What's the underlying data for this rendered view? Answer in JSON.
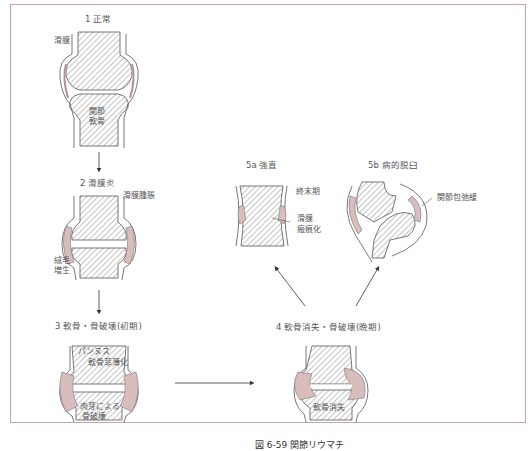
{
  "figure": {
    "caption": "図 6-59  関節リウマチ",
    "frame_color": "#c9a3a6",
    "hatch_color": "#888888",
    "inflamed_color": "#d9bcbc"
  },
  "stages": [
    {
      "id": "1",
      "title": "1  正常",
      "labels": [
        "滑膜",
        "関節\n軟骨"
      ]
    },
    {
      "id": "2",
      "title": "2  滑膜炎",
      "labels": [
        "滑膜腫脹",
        "絨毛\n増生"
      ]
    },
    {
      "id": "3",
      "title": "3  軟骨・骨破壊(初期)",
      "labels": [
        "パンヌス",
        "軟骨菲薄化",
        "肉芽による\n骨破壊"
      ]
    },
    {
      "id": "4",
      "title": "4  軟骨消失・骨破壊(晩期)",
      "labels": [
        "軟骨消失"
      ]
    },
    {
      "id": "5a",
      "title": "5a  強直",
      "labels": [
        "終末期",
        "滑膜\n瘢痕化"
      ]
    },
    {
      "id": "5b",
      "title": "5b  病的脱臼",
      "labels": [
        "関節包弛緩"
      ]
    }
  ],
  "labels": {
    "s1_title": "1  正常",
    "s1_synovium": "滑膜",
    "s1_cart1": "関節",
    "s1_cart2": "軟骨",
    "s2_title": "2  滑膜炎",
    "s2_swelling": "滑膜腫脹",
    "s2_villi1": "絨毛",
    "s2_villi2": "増生",
    "s3_title": "3  軟骨・骨破壊(初期)",
    "s3_pannus": "パンヌス",
    "s3_thin": "軟骨菲薄化",
    "s3_gran1": "肉芽による",
    "s3_gran2": "骨破壊",
    "s4_title": "4  軟骨消失・骨破壊(晩期)",
    "s4_loss": "軟骨消失",
    "s5a_title": "5a  強直",
    "s5a_end": "終末期",
    "s5a_scar1": "滑膜",
    "s5a_scar2": "瘢痕化",
    "s5b_title": "5b  病的脱臼",
    "s5b_capsule": "関節包弛緩"
  }
}
